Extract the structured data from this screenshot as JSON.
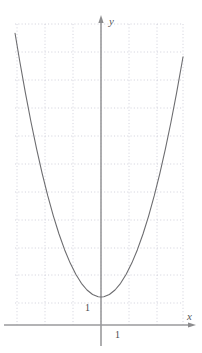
{
  "figure": {
    "width": 202,
    "height": 353,
    "background_color": "#ffffff"
  },
  "axes": {
    "x_axis_label": "x",
    "y_axis_label": "y",
    "axis_color": "#8c8c8e",
    "arrowheads": true,
    "x_axis_pixel_y": 325,
    "y_axis_pixel_x": 101
  },
  "grid": {
    "visible": true,
    "style": "dotted",
    "color": "#c9c9d6",
    "spacing_px": 28,
    "left_px": 15,
    "right_px": 183,
    "top_px": 24,
    "bottom_px": 325
  },
  "tick_labels": {
    "y_one": "1",
    "x_one": "1"
  },
  "curve": {
    "color": "#6d6d70",
    "width_px": 1.1,
    "description": "upward-opening parabola"
  },
  "chart_data": {
    "type": "line",
    "title": "",
    "subtitle": "",
    "xlabel": "x",
    "ylabel": "y",
    "xlim": [
      -3.07,
      2.93
    ],
    "ylim": [
      0,
      11.25
    ],
    "grid": true,
    "legend": null,
    "annotations": [
      {
        "text": "1",
        "x": -0.2,
        "y": 1.0,
        "role": "y-tick-at-vertex"
      },
      {
        "text": "1",
        "x": 1.0,
        "y": -0.45,
        "role": "x-tick"
      }
    ],
    "series": [
      {
        "name": "y = x^2 + 1",
        "x": [
          -3.07,
          -2.9,
          -2.7,
          -2.5,
          -2.3,
          -2.1,
          -1.9,
          -1.7,
          -1.5,
          -1.3,
          -1.1,
          -0.9,
          -0.7,
          -0.5,
          -0.3,
          -0.1,
          0.0,
          0.1,
          0.3,
          0.5,
          0.7,
          0.9,
          1.1,
          1.3,
          1.5,
          1.7,
          1.9,
          2.1,
          2.3,
          2.5,
          2.7,
          2.9,
          2.93
        ],
        "y": [
          10.42,
          9.41,
          8.29,
          7.25,
          6.29,
          5.41,
          4.61,
          3.89,
          3.25,
          2.69,
          2.21,
          1.81,
          1.49,
          1.25,
          1.09,
          1.01,
          1.0,
          1.01,
          1.09,
          1.25,
          1.49,
          1.81,
          2.21,
          2.69,
          3.25,
          3.89,
          4.61,
          5.41,
          6.29,
          7.25,
          8.29,
          9.41,
          9.58
        ]
      }
    ],
    "vertex": {
      "x": 0,
      "y": 1
    }
  }
}
